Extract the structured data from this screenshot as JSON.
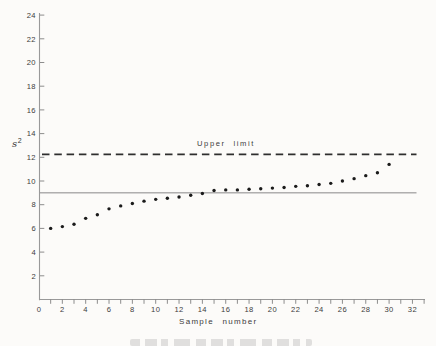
{
  "colors": {
    "background": "#fcfbf9",
    "ink": "#2e2e2e",
    "point": "#1b1b1b",
    "axis": "#999999",
    "center_line": "#7a7a7a",
    "label_text": "#3c3c3c"
  },
  "chart_data": {
    "type": "scatter",
    "title": "",
    "xlabel": "Sample number",
    "ylabel": "s²",
    "ylabel_parts": {
      "base": "s",
      "sup": "2"
    },
    "xlim": [
      0,
      33
    ],
    "ylim": [
      0,
      24
    ],
    "grid": false,
    "legend": "none",
    "marker": "filled-circle",
    "x_ticks_labeled": [
      0,
      2,
      4,
      6,
      8,
      10,
      12,
      14,
      16,
      18,
      20,
      22,
      24,
      26,
      28,
      30,
      32
    ],
    "x_minor_tick_step": 1,
    "y_ticks": [
      2,
      4,
      6,
      8,
      10,
      12,
      14,
      16,
      18,
      20,
      22,
      24
    ],
    "x": [
      1,
      2,
      3,
      4,
      5,
      6,
      7,
      8,
      9,
      10,
      11,
      12,
      13,
      14,
      15,
      16,
      17,
      18,
      19,
      20,
      21,
      22,
      23,
      24,
      25,
      26,
      27,
      28,
      29,
      30
    ],
    "y": [
      6.0,
      6.15,
      6.35,
      6.85,
      7.15,
      7.65,
      7.9,
      8.1,
      8.3,
      8.45,
      8.55,
      8.65,
      8.8,
      8.95,
      9.2,
      9.25,
      9.25,
      9.3,
      9.35,
      9.4,
      9.45,
      9.55,
      9.6,
      9.7,
      9.8,
      10.0,
      10.2,
      10.45,
      10.7,
      11.4
    ],
    "reference_lines": [
      {
        "label": "Upper limit",
        "value": 12.25,
        "style": "dashed"
      },
      {
        "label": "",
        "value": 9.0,
        "style": "solid"
      }
    ]
  }
}
